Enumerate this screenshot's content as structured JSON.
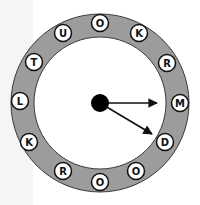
{
  "puzzle": {
    "type": "circular-word-wheel",
    "colors": {
      "ring": "#9c9c9c",
      "ring_border": "#3a3a3a",
      "inner": "#ffffff",
      "letter_bg": "#ffffff",
      "letter_border": "#111111",
      "hub": "#000000",
      "arrow": "#111111"
    },
    "letters": [
      {
        "char": "O",
        "x": 100,
        "y": 23
      },
      {
        "char": "K",
        "x": 139,
        "y": 33
      },
      {
        "char": "R",
        "x": 167,
        "y": 63
      },
      {
        "char": "M",
        "x": 180,
        "y": 103
      },
      {
        "char": "D",
        "x": 165,
        "y": 142
      },
      {
        "char": "O",
        "x": 136,
        "y": 171
      },
      {
        "char": "O",
        "x": 100,
        "y": 182
      },
      {
        "char": "R",
        "x": 63,
        "y": 171
      },
      {
        "char": "K",
        "x": 29,
        "y": 142
      },
      {
        "char": "L",
        "x": 20,
        "y": 101
      },
      {
        "char": "T",
        "x": 34,
        "y": 62
      },
      {
        "char": "U",
        "x": 63,
        "y": 33
      }
    ],
    "arrows": [
      {
        "points_to": "M",
        "x2": 157,
        "y2": 103
      },
      {
        "points_to": "D",
        "x2": 152,
        "y2": 134
      }
    ]
  }
}
